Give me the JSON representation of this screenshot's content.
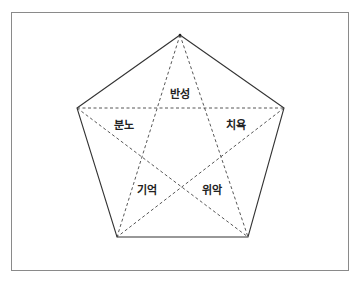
{
  "diagram": {
    "type": "pentagram-in-pentagon",
    "colors": {
      "stroke": "#333333",
      "frame": "#8a8a8a",
      "text": "#222222",
      "background": "#ffffff"
    },
    "vertices": {
      "top": [
        180,
        35
      ],
      "right": [
        284,
        108
      ],
      "bottom_right": [
        248,
        237
      ],
      "bottom_left": [
        117,
        237
      ],
      "left": [
        77,
        108
      ]
    },
    "labels": [
      {
        "id": "reflection",
        "text": "반성",
        "x": 180,
        "y": 94
      },
      {
        "id": "anger",
        "text": "분노",
        "x": 124,
        "y": 125
      },
      {
        "id": "healing",
        "text": "치욕",
        "x": 236,
        "y": 125
      },
      {
        "id": "memory",
        "text": "기억",
        "x": 147,
        "y": 190
      },
      {
        "id": "comfort",
        "text": "위악",
        "x": 212,
        "y": 190
      }
    ]
  }
}
